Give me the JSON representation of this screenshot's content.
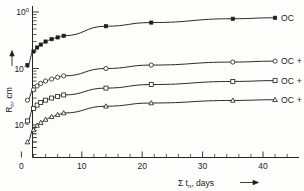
{
  "chart_data": {
    "type": "line",
    "title": "",
    "xlabel": "Σ tₙ, days",
    "ylabel": "Rₙ, cm",
    "xscale": "linear",
    "yscale": "log",
    "xlim": [
      0,
      44
    ],
    "ylim": [
      0.004,
      1.0
    ],
    "grid": false,
    "legend_position": "right-inline-labels",
    "x_ticks": [
      {
        "value": 0,
        "label": "0"
      },
      {
        "value": 10,
        "label": "10"
      },
      {
        "value": 20,
        "label": "20"
      },
      {
        "value": 30,
        "label": "30"
      },
      {
        "value": 40,
        "label": "40"
      }
    ],
    "x_minor_tick_step": 2,
    "y_ticks": [
      {
        "value": 1,
        "mantissa": "10",
        "exponent": "0"
      },
      {
        "value": 0.1,
        "mantissa": "10",
        "exponent": "-1"
      },
      {
        "value": 0.01,
        "mantissa": "10",
        "exponent": "-2"
      }
    ],
    "series": [
      {
        "name": "OC",
        "label": "OC",
        "marker": "filled-square",
        "points": [
          {
            "x": 1,
            "y": 0.115
          },
          {
            "x": 2,
            "y": 0.2
          },
          {
            "x": 2.6,
            "y": 0.235
          },
          {
            "x": 3.2,
            "y": 0.265
          },
          {
            "x": 4,
            "y": 0.3
          },
          {
            "x": 5,
            "y": 0.33
          },
          {
            "x": 6,
            "y": 0.355
          },
          {
            "x": 7,
            "y": 0.38
          },
          {
            "x": 14,
            "y": 0.56
          },
          {
            "x": 21.5,
            "y": 0.65
          },
          {
            "x": 35,
            "y": 0.76
          },
          {
            "x": 42,
            "y": 0.79
          }
        ]
      },
      {
        "name": "OC + 2.5% vermic.",
        "label": "OC + 2.5 % vermic.",
        "marker": "open-circle",
        "points": [
          {
            "x": 1,
            "y": 0.0275
          },
          {
            "x": 2,
            "y": 0.042
          },
          {
            "x": 2.6,
            "y": 0.049
          },
          {
            "x": 3.2,
            "y": 0.0545
          },
          {
            "x": 4,
            "y": 0.06
          },
          {
            "x": 5,
            "y": 0.065
          },
          {
            "x": 6,
            "y": 0.07
          },
          {
            "x": 7,
            "y": 0.074
          },
          {
            "x": 14,
            "y": 0.1
          },
          {
            "x": 21.5,
            "y": 0.115
          },
          {
            "x": 35,
            "y": 0.13
          },
          {
            "x": 42,
            "y": 0.135
          }
        ]
      },
      {
        "name": "OC + 5% vermic.",
        "label": "OC + 5 %  vermic.",
        "marker": "open-square",
        "points": [
          {
            "x": 1,
            "y": 0.0118
          },
          {
            "x": 2,
            "y": 0.0195
          },
          {
            "x": 2.6,
            "y": 0.0225
          },
          {
            "x": 3.2,
            "y": 0.025
          },
          {
            "x": 4,
            "y": 0.0275
          },
          {
            "x": 5,
            "y": 0.03
          },
          {
            "x": 6,
            "y": 0.032
          },
          {
            "x": 7,
            "y": 0.034
          },
          {
            "x": 14,
            "y": 0.045
          },
          {
            "x": 21.5,
            "y": 0.052
          },
          {
            "x": 35,
            "y": 0.059
          },
          {
            "x": 42,
            "y": 0.061
          }
        ]
      },
      {
        "name": "OC + 10% vermic.",
        "label": "OC + 10 % vermic.",
        "marker": "open-triangle",
        "points": [
          {
            "x": 1,
            "y": 0.005
          },
          {
            "x": 2,
            "y": 0.0082
          },
          {
            "x": 2.6,
            "y": 0.0098
          },
          {
            "x": 3.2,
            "y": 0.011
          },
          {
            "x": 4,
            "y": 0.0125
          },
          {
            "x": 5,
            "y": 0.014
          },
          {
            "x": 6,
            "y": 0.0152
          },
          {
            "x": 7,
            "y": 0.0163
          },
          {
            "x": 14,
            "y": 0.0215
          },
          {
            "x": 21.5,
            "y": 0.0245
          },
          {
            "x": 35,
            "y": 0.0272
          },
          {
            "x": 42,
            "y": 0.028
          }
        ]
      }
    ],
    "arrows": {
      "y_axis_arrow": "up",
      "x_axis_arrow": "right"
    }
  },
  "colors": {
    "background": "#fdfdfb",
    "ink": "#1d1d1d",
    "marker_fill": "#ffffff"
  }
}
